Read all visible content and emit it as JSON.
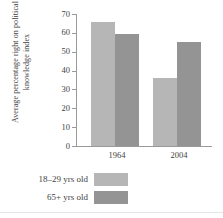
{
  "chart_data": {
    "type": "bar",
    "title": "",
    "xlabel": "",
    "ylabel": "Average percentage right on political knowledge index",
    "categories": [
      "1964",
      "2004"
    ],
    "series": [
      {
        "name": "18–29 yrs old",
        "values": [
          66,
          36
        ],
        "color": "#b6b6b6"
      },
      {
        "name": "65+ yrs old",
        "values": [
          59.5,
          55
        ],
        "color": "#949494"
      }
    ],
    "ylim": [
      0,
      70
    ],
    "yticks": [
      70,
      60,
      50,
      40,
      30,
      20,
      10,
      0
    ],
    "grid": false,
    "legend_position": "bottom-left"
  },
  "axis": {
    "line_color": "#9a9a9a"
  },
  "legend": {
    "entries": [
      {
        "label": "18–29 yrs old",
        "color": "#b6b6b6"
      },
      {
        "label": "65+ yrs old",
        "color": "#949494"
      }
    ]
  }
}
